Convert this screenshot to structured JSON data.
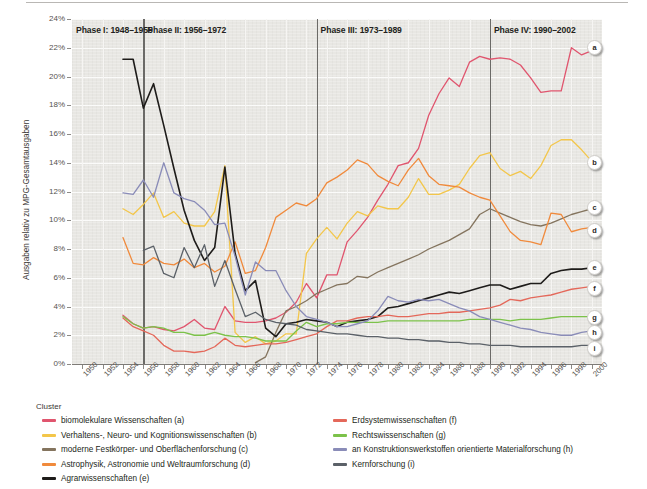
{
  "chart_data": {
    "type": "line",
    "title": "",
    "xlabel": "",
    "ylabel": "Ausgaben relativ zu MPG-Gesamtausgaben",
    "xlim": [
      1949,
      2001
    ],
    "ylim": [
      0,
      24
    ],
    "y_tick_labels": [
      "0%",
      "2%",
      "4%",
      "6%",
      "8%",
      "10%",
      "12%",
      "14%",
      "16%",
      "18%",
      "20%",
      "22%",
      "24%"
    ],
    "y_tick_values": [
      0,
      2,
      4,
      6,
      8,
      10,
      12,
      14,
      16,
      18,
      20,
      22,
      24
    ],
    "x_tick_labels": [
      "1950",
      "1952",
      "1954",
      "1956",
      "1958",
      "1960",
      "1962",
      "1964",
      "1966",
      "1968",
      "1970",
      "1972",
      "1974",
      "1976",
      "1978",
      "1980",
      "1982",
      "1984",
      "1986",
      "1988",
      "1990",
      "1992",
      "1994",
      "1996",
      "1998",
      "2000"
    ],
    "x_tick_values": [
      1950,
      1952,
      1954,
      1956,
      1958,
      1960,
      1962,
      1964,
      1966,
      1968,
      1970,
      1972,
      1974,
      1976,
      1978,
      1980,
      1982,
      1984,
      1986,
      1988,
      1990,
      1992,
      1994,
      1996,
      1998,
      2000
    ],
    "grid": true,
    "legend_position": "below",
    "annotations": [
      {
        "id": "phase1",
        "label": "Phase I: 1948–1955",
        "x": 1949
      },
      {
        "id": "phase2",
        "label": "Phase II: 1956–1972",
        "x": 1956
      },
      {
        "id": "phase3",
        "label": "Phase III: 1973–1989",
        "x": 1973
      },
      {
        "id": "phase4",
        "label": "Phase IV: 1990–2002",
        "x": 1990
      }
    ],
    "phase_dividers": [
      1956,
      1973,
      1990
    ],
    "series": [
      {
        "key": "a",
        "name": "biomolekulare Wissenschaften (a)",
        "color": "#e0556e",
        "end_label": "a",
        "x": [
          1954,
          1955,
          1956,
          1957,
          1958,
          1959,
          1960,
          1961,
          1962,
          1963,
          1964,
          1965,
          1966,
          1967,
          1968,
          1969,
          1970,
          1971,
          1972,
          1973,
          1974,
          1975,
          1976,
          1977,
          1978,
          1979,
          1980,
          1981,
          1982,
          1983,
          1984,
          1985,
          1986,
          1987,
          1988,
          1989,
          1990,
          1991,
          1992,
          1993,
          1994,
          1995,
          1996,
          1997,
          1998,
          1999,
          2000
        ],
        "values": [
          3.4,
          2.8,
          2.5,
          2.6,
          2.4,
          2.3,
          2.6,
          3.1,
          2.5,
          2.4,
          4.0,
          3.0,
          2.9,
          2.9,
          3.0,
          3.2,
          3.6,
          4.3,
          5.6,
          4.6,
          6.2,
          6.2,
          8.5,
          9.3,
          10.2,
          11.4,
          12.5,
          13.8,
          14.0,
          15.0,
          17.3,
          18.8,
          19.9,
          19.3,
          21.0,
          21.4,
          21.2,
          21.3,
          21.2,
          20.8,
          19.9,
          18.9,
          19.0,
          19.0,
          22.0,
          21.5,
          21.8
        ]
      },
      {
        "key": "b",
        "name": "Verhaltens-, Neuro- und Kognitionswissenschaften (b)",
        "color": "#f3c64a",
        "end_label": "b",
        "x": [
          1954,
          1955,
          1956,
          1957,
          1958,
          1959,
          1960,
          1961,
          1962,
          1963,
          1964,
          1965,
          1966,
          1967,
          1968,
          1969,
          1970,
          1971,
          1972,
          1973,
          1974,
          1975,
          1976,
          1977,
          1978,
          1979,
          1980,
          1981,
          1982,
          1983,
          1984,
          1985,
          1986,
          1987,
          1988,
          1989,
          1990,
          1991,
          1992,
          1993,
          1994,
          1995,
          1996,
          1997,
          1998,
          1999,
          2000
        ],
        "values": [
          10.8,
          10.4,
          11.1,
          11.9,
          10.2,
          10.6,
          9.8,
          9.6,
          9.6,
          10.6,
          13.8,
          2.2,
          1.5,
          1.9,
          1.4,
          1.6,
          2.1,
          2.1,
          7.7,
          8.7,
          9.5,
          8.7,
          9.8,
          10.6,
          10.3,
          11.0,
          10.8,
          10.8,
          11.6,
          12.9,
          11.8,
          11.8,
          12.1,
          12.5,
          13.6,
          14.5,
          14.7,
          13.6,
          13.1,
          13.4,
          12.9,
          13.8,
          15.2,
          15.6,
          15.6,
          14.9,
          14.1
        ]
      },
      {
        "key": "c",
        "name": "moderne Festkörper- und Oberflächenforschung (c)",
        "color": "#84745e",
        "end_label": "c",
        "x": [
          1967,
          1968,
          1969,
          1970,
          1971,
          1972,
          1973,
          1974,
          1975,
          1976,
          1977,
          1978,
          1979,
          1980,
          1981,
          1982,
          1983,
          1984,
          1985,
          1986,
          1987,
          1988,
          1989,
          1990,
          1991,
          1992,
          1993,
          1994,
          1995,
          1996,
          1997,
          1998,
          1999,
          2000
        ],
        "values": [
          0.1,
          0.5,
          2.2,
          3.7,
          4.0,
          4.4,
          4.9,
          5.2,
          5.5,
          5.6,
          6.1,
          6.0,
          6.4,
          6.7,
          7.0,
          7.3,
          7.6,
          8.0,
          8.3,
          8.6,
          9.0,
          9.4,
          10.4,
          10.8,
          10.5,
          10.2,
          9.9,
          9.7,
          9.6,
          9.8,
          10.1,
          10.4,
          10.6,
          10.8
        ]
      },
      {
        "key": "d",
        "name": "Astrophysik, Astronomie und Weltraumforschung (d)",
        "color": "#f08a3c",
        "end_label": "d",
        "x": [
          1954,
          1955,
          1956,
          1957,
          1958,
          1959,
          1960,
          1961,
          1962,
          1963,
          1964,
          1965,
          1966,
          1967,
          1968,
          1969,
          1970,
          1971,
          1972,
          1973,
          1974,
          1975,
          1976,
          1977,
          1978,
          1979,
          1980,
          1981,
          1982,
          1983,
          1984,
          1985,
          1986,
          1987,
          1988,
          1989,
          1990,
          1991,
          1992,
          1993,
          1994,
          1995,
          1996,
          1997,
          1998,
          1999,
          2000
        ],
        "values": [
          8.8,
          7.0,
          6.9,
          7.4,
          7.0,
          6.9,
          7.3,
          6.7,
          7.0,
          6.4,
          6.8,
          8.5,
          6.3,
          6.5,
          8.1,
          10.2,
          10.7,
          11.2,
          11.0,
          11.5,
          12.6,
          13.0,
          13.5,
          14.2,
          13.9,
          13.1,
          12.7,
          12.4,
          13.5,
          14.3,
          13.1,
          12.5,
          12.4,
          12.3,
          11.9,
          11.6,
          11.4,
          10.3,
          9.2,
          8.6,
          8.5,
          8.3,
          10.5,
          10.4,
          9.2,
          9.4,
          9.5
        ]
      },
      {
        "key": "e",
        "name": "Agrarwissenschaften (e)",
        "color": "#1e1c1a",
        "end_label": "e",
        "x": [
          1954,
          1955,
          1956,
          1957,
          1958,
          1959,
          1960,
          1961,
          1962,
          1963,
          1964,
          1965,
          1966,
          1967,
          1968,
          1969,
          1970,
          1971,
          1972,
          1973,
          1974,
          1975,
          1976,
          1977,
          1978,
          1979,
          1980,
          1981,
          1982,
          1983,
          1984,
          1985,
          1986,
          1987,
          1988,
          1989,
          1990,
          1991,
          1992,
          1993,
          1994,
          1995,
          1996,
          1997,
          1998,
          1999,
          2000
        ],
        "values": [
          21.2,
          21.2,
          17.8,
          19.5,
          16.6,
          13.6,
          10.7,
          8.6,
          7.2,
          8.1,
          13.7,
          7.7,
          5.1,
          5.8,
          2.5,
          1.9,
          2.8,
          2.9,
          3.1,
          3.0,
          2.9,
          2.6,
          2.9,
          3.0,
          3.1,
          3.3,
          3.9,
          4.0,
          4.2,
          4.4,
          4.6,
          4.8,
          5.0,
          4.9,
          5.1,
          5.3,
          5.5,
          5.5,
          5.2,
          5.4,
          5.6,
          5.6,
          6.3,
          6.5,
          6.6,
          6.6,
          6.7
        ]
      },
      {
        "key": "f",
        "name": "Erdsystemwissenschaften (f)",
        "color": "#e4685a",
        "end_label": "f",
        "x": [
          1954,
          1955,
          1956,
          1957,
          1958,
          1959,
          1960,
          1961,
          1962,
          1963,
          1964,
          1965,
          1966,
          1967,
          1968,
          1969,
          1970,
          1971,
          1972,
          1973,
          1974,
          1975,
          1976,
          1977,
          1978,
          1979,
          1980,
          1981,
          1982,
          1983,
          1984,
          1985,
          1986,
          1987,
          1988,
          1989,
          1990,
          1991,
          1992,
          1993,
          1994,
          1995,
          1996,
          1997,
          1998,
          1999,
          2000
        ],
        "values": [
          3.2,
          2.6,
          2.3,
          2.0,
          1.3,
          0.9,
          0.9,
          0.8,
          0.9,
          1.2,
          1.8,
          1.3,
          1.2,
          1.3,
          1.4,
          1.4,
          1.5,
          1.7,
          1.9,
          2.1,
          2.6,
          3.0,
          3.0,
          3.2,
          3.3,
          3.3,
          3.4,
          3.3,
          3.3,
          3.4,
          3.5,
          3.5,
          3.6,
          3.6,
          3.7,
          3.8,
          3.9,
          4.1,
          4.5,
          4.4,
          4.6,
          4.7,
          4.8,
          5.0,
          5.2,
          5.3,
          5.4
        ]
      },
      {
        "key": "g",
        "name": "Rechtswissenschaften (g)",
        "color": "#7cc24a",
        "end_label": "g",
        "x": [
          1954,
          1955,
          1956,
          1957,
          1958,
          1959,
          1960,
          1961,
          1962,
          1963,
          1964,
          1965,
          1966,
          1967,
          1968,
          1969,
          1970,
          1971,
          1972,
          1973,
          1974,
          1975,
          1976,
          1977,
          1978,
          1979,
          1980,
          1981,
          1982,
          1983,
          1984,
          1985,
          1986,
          1987,
          1988,
          1989,
          1990,
          1991,
          1992,
          1993,
          1994,
          1995,
          1996,
          1997,
          1998,
          1999,
          2000
        ],
        "values": [
          3.3,
          2.8,
          2.5,
          2.6,
          2.5,
          2.2,
          2.2,
          2.0,
          2.0,
          2.2,
          2.0,
          1.9,
          1.9,
          1.8,
          1.6,
          1.6,
          1.6,
          2.3,
          2.9,
          2.6,
          2.8,
          2.8,
          2.9,
          2.9,
          2.9,
          2.9,
          3.0,
          3.0,
          3.0,
          3.0,
          3.0,
          3.0,
          3.0,
          3.0,
          3.1,
          3.1,
          3.1,
          3.1,
          3.0,
          3.1,
          3.1,
          3.1,
          3.2,
          3.3,
          3.3,
          3.3,
          3.3
        ]
      },
      {
        "key": "h",
        "name": "an Konstruktionswerkstoffen orientierte Materialforschung (h)",
        "color": "#8a8cb8",
        "end_label": "h",
        "x": [
          1954,
          1955,
          1956,
          1957,
          1958,
          1959,
          1960,
          1961,
          1962,
          1963,
          1964,
          1965,
          1966,
          1967,
          1968,
          1969,
          1970,
          1971,
          1972,
          1973,
          1974,
          1975,
          1976,
          1977,
          1978,
          1979,
          1980,
          1981,
          1982,
          1983,
          1984,
          1985,
          1986,
          1987,
          1988,
          1989,
          1990,
          1991,
          1992,
          1993,
          1994,
          1995,
          1996,
          1997,
          1998,
          1999,
          2000
        ],
        "values": [
          11.9,
          11.8,
          12.8,
          11.6,
          14.0,
          11.9,
          11.5,
          11.3,
          10.7,
          9.7,
          9.8,
          7.5,
          4.8,
          7.1,
          6.5,
          6.5,
          5.1,
          4.0,
          3.3,
          3.1,
          2.9,
          2.6,
          2.6,
          2.8,
          3.0,
          3.7,
          4.7,
          4.4,
          4.3,
          4.5,
          4.4,
          4.5,
          4.2,
          3.9,
          3.7,
          3.3,
          3.1,
          2.9,
          2.7,
          2.5,
          2.4,
          2.2,
          2.1,
          2.0,
          2.0,
          2.2,
          2.3
        ]
      },
      {
        "key": "i",
        "name": "Kernforschung (i)",
        "color": "#5b6168",
        "end_label": "i",
        "x": [
          1956,
          1957,
          1958,
          1959,
          1960,
          1961,
          1962,
          1963,
          1964,
          1965,
          1966,
          1967,
          1968,
          1969,
          1970,
          1971,
          1972,
          1973,
          1974,
          1975,
          1976,
          1977,
          1978,
          1979,
          1980,
          1981,
          1982,
          1983,
          1984,
          1985,
          1986,
          1987,
          1988,
          1989,
          1990,
          1991,
          1992,
          1993,
          1994,
          1995,
          1996,
          1997,
          1998,
          1999,
          2000
        ],
        "values": [
          7.9,
          8.2,
          6.3,
          6.0,
          8.1,
          6.7,
          8.3,
          5.4,
          7.2,
          5.2,
          3.3,
          3.6,
          3.1,
          2.9,
          2.8,
          2.7,
          2.4,
          2.3,
          2.2,
          2.1,
          2.1,
          2.0,
          1.9,
          1.9,
          1.8,
          1.8,
          1.7,
          1.7,
          1.6,
          1.6,
          1.5,
          1.5,
          1.4,
          1.4,
          1.3,
          1.3,
          1.3,
          1.2,
          1.2,
          1.2,
          1.2,
          1.2,
          1.2,
          1.3,
          1.3
        ]
      }
    ]
  },
  "legend": {
    "title": "Cluster",
    "column1": [
      {
        "label": "biomolekulare Wissenschaften (a)",
        "color": "#e0556e"
      },
      {
        "label": "Verhaltens-, Neuro- und Kognitionswissenschaften (b)",
        "color": "#f3c64a"
      },
      {
        "label": "moderne Festkörper- und Oberflächenforschung (c)",
        "color": "#84745e"
      },
      {
        "label": "Astrophysik, Astronomie und Weltraumforschung (d)",
        "color": "#f08a3c"
      },
      {
        "label": "Agrarwissenschaften (e)",
        "color": "#1e1c1a"
      }
    ],
    "column2": [
      {
        "label": "Erdsystemwissenschaften (f)",
        "color": "#e4685a"
      },
      {
        "label": "Rechtswissenschaften (g)",
        "color": "#7cc24a"
      },
      {
        "label": "an Konstruktionswerkstoffen orientierte Materialforschung (h)",
        "color": "#8a8cb8"
      },
      {
        "label": "Kernforschung (i)",
        "color": "#5b6168"
      }
    ]
  }
}
